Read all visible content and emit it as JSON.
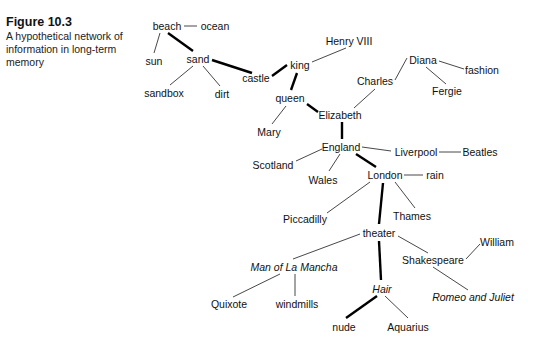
{
  "caption": {
    "figure_label": "Figure 10.3",
    "description": "A hypothetical network of information in long-term memory"
  },
  "nodes": {
    "beach": {
      "label": "beach",
      "x": 167,
      "y": 26,
      "italic": false
    },
    "ocean": {
      "label": "ocean",
      "x": 215,
      "y": 26,
      "italic": false
    },
    "sun": {
      "label": "sun",
      "x": 154,
      "y": 61,
      "italic": false
    },
    "sand": {
      "label": "sand",
      "x": 198,
      "y": 59,
      "italic": false
    },
    "sandbox": {
      "label": "sandbox",
      "x": 164,
      "y": 93,
      "italic": false
    },
    "dirt": {
      "label": "dirt",
      "x": 222,
      "y": 94,
      "italic": false
    },
    "castle": {
      "label": "castle",
      "x": 256,
      "y": 78,
      "italic": false
    },
    "king": {
      "label": "king",
      "x": 300,
      "y": 65,
      "italic": false
    },
    "henry": {
      "label": "Henry VIII",
      "x": 349,
      "y": 41,
      "italic": false
    },
    "queen": {
      "label": "queen",
      "x": 290,
      "y": 98,
      "italic": false
    },
    "mary": {
      "label": "Mary",
      "x": 269,
      "y": 132,
      "italic": false
    },
    "elizabeth": {
      "label": "Elizabeth",
      "x": 340,
      "y": 115,
      "italic": false
    },
    "charles": {
      "label": "Charles",
      "x": 375,
      "y": 81,
      "italic": false
    },
    "diana": {
      "label": "Diana",
      "x": 423,
      "y": 60,
      "italic": false
    },
    "fashion": {
      "label": "fashion",
      "x": 482,
      "y": 70,
      "italic": false
    },
    "fergie": {
      "label": "Fergie",
      "x": 447,
      "y": 91,
      "italic": false
    },
    "england": {
      "label": "England",
      "x": 341,
      "y": 147,
      "italic": false
    },
    "scotland": {
      "label": "Scotland",
      "x": 273,
      "y": 165,
      "italic": false
    },
    "wales": {
      "label": "Wales",
      "x": 323,
      "y": 180,
      "italic": false
    },
    "liverpool": {
      "label": "Liverpool",
      "x": 416,
      "y": 152,
      "italic": false
    },
    "beatles": {
      "label": "Beatles",
      "x": 480,
      "y": 152,
      "italic": false
    },
    "london": {
      "label": "London",
      "x": 385,
      "y": 175,
      "italic": false
    },
    "rain": {
      "label": "rain",
      "x": 435,
      "y": 175,
      "italic": false
    },
    "piccadilly": {
      "label": "Piccadilly",
      "x": 305,
      "y": 219,
      "italic": false
    },
    "thames": {
      "label": "Thames",
      "x": 412,
      "y": 216,
      "italic": false
    },
    "theater": {
      "label": "theater",
      "x": 379,
      "y": 233,
      "italic": false
    },
    "mancha": {
      "label": "Man of La Mancha",
      "x": 294,
      "y": 267,
      "italic": true
    },
    "shakespeare": {
      "label": "Shakespeare",
      "x": 433,
      "y": 260,
      "italic": false
    },
    "william": {
      "label": "William",
      "x": 497,
      "y": 242,
      "italic": false
    },
    "quixote": {
      "label": "Quixote",
      "x": 229,
      "y": 304,
      "italic": false
    },
    "windmills": {
      "label": "windmills",
      "x": 297,
      "y": 304,
      "italic": false
    },
    "hair": {
      "label": "Hair",
      "x": 382,
      "y": 289,
      "italic": true
    },
    "romeo": {
      "label": "Romeo and Juliet",
      "x": 473,
      "y": 297,
      "italic": true
    },
    "nude": {
      "label": "nude",
      "x": 344,
      "y": 327,
      "italic": false
    },
    "aquarius": {
      "label": "Aquarius",
      "x": 408,
      "y": 327,
      "italic": false
    }
  },
  "edges": [
    {
      "from": "beach",
      "to": "ocean",
      "x1": 184,
      "y1": 26,
      "x2": 197,
      "y2": 26,
      "weight": "thin"
    },
    {
      "from": "beach",
      "to": "sun",
      "x1": 160,
      "y1": 33,
      "x2": 154,
      "y2": 53,
      "weight": "thin"
    },
    {
      "from": "beach",
      "to": "sand",
      "x1": 168,
      "y1": 33,
      "x2": 193,
      "y2": 51,
      "weight": "thick"
    },
    {
      "from": "sand",
      "to": "sandbox",
      "x1": 193,
      "y1": 66,
      "x2": 170,
      "y2": 85,
      "weight": "thin"
    },
    {
      "from": "sand",
      "to": "dirt",
      "x1": 203,
      "y1": 66,
      "x2": 220,
      "y2": 86,
      "weight": "thin"
    },
    {
      "from": "sand",
      "to": "castle",
      "x1": 212,
      "y1": 60,
      "x2": 252,
      "y2": 73,
      "weight": "thick"
    },
    {
      "from": "castle",
      "to": "king",
      "x1": 272,
      "y1": 76,
      "x2": 287,
      "y2": 65,
      "weight": "thick"
    },
    {
      "from": "king",
      "to": "henry",
      "x1": 312,
      "y1": 62,
      "x2": 346,
      "y2": 48,
      "weight": "thin"
    },
    {
      "from": "king",
      "to": "queen",
      "x1": 297,
      "y1": 73,
      "x2": 291,
      "y2": 90,
      "weight": "thick"
    },
    {
      "from": "queen",
      "to": "mary",
      "x1": 286,
      "y1": 106,
      "x2": 272,
      "y2": 124,
      "weight": "thin"
    },
    {
      "from": "queen",
      "to": "elizabeth",
      "x1": 307,
      "y1": 104,
      "x2": 318,
      "y2": 112,
      "weight": "thick"
    },
    {
      "from": "elizabeth",
      "to": "charles",
      "x1": 354,
      "y1": 108,
      "x2": 375,
      "y2": 89,
      "weight": "thin"
    },
    {
      "from": "charles",
      "to": "diana",
      "x1": 395,
      "y1": 80,
      "x2": 407,
      "y2": 58,
      "weight": "thin"
    },
    {
      "from": "diana",
      "to": "fashion",
      "x1": 439,
      "y1": 61,
      "x2": 464,
      "y2": 69,
      "weight": "thin"
    },
    {
      "from": "diana",
      "to": "fergie",
      "x1": 426,
      "y1": 67,
      "x2": 446,
      "y2": 84,
      "weight": "thin"
    },
    {
      "from": "elizabeth",
      "to": "england",
      "x1": 342,
      "y1": 122,
      "x2": 342,
      "y2": 139,
      "weight": "thick"
    },
    {
      "from": "england",
      "to": "scotland",
      "x1": 322,
      "y1": 149,
      "x2": 296,
      "y2": 161,
      "weight": "thin"
    },
    {
      "from": "england",
      "to": "wales",
      "x1": 340,
      "y1": 154,
      "x2": 329,
      "y2": 171,
      "weight": "thin"
    },
    {
      "from": "england",
      "to": "liverpool",
      "x1": 362,
      "y1": 147,
      "x2": 391,
      "y2": 151,
      "weight": "thin"
    },
    {
      "from": "liverpool",
      "to": "beatles",
      "x1": 439,
      "y1": 152,
      "x2": 461,
      "y2": 152,
      "weight": "thin"
    },
    {
      "from": "england",
      "to": "london",
      "x1": 356,
      "y1": 154,
      "x2": 376,
      "y2": 167,
      "weight": "thick"
    },
    {
      "from": "london",
      "to": "rain",
      "x1": 404,
      "y1": 175,
      "x2": 423,
      "y2": 175,
      "weight": "thin"
    },
    {
      "from": "london",
      "to": "piccadilly",
      "x1": 370,
      "y1": 182,
      "x2": 327,
      "y2": 213,
      "weight": "thin"
    },
    {
      "from": "london",
      "to": "thames",
      "x1": 395,
      "y1": 182,
      "x2": 415,
      "y2": 208,
      "weight": "thin"
    },
    {
      "from": "london",
      "to": "theater",
      "x1": 383,
      "y1": 183,
      "x2": 379,
      "y2": 224,
      "weight": "thick"
    },
    {
      "from": "theater",
      "to": "mancha",
      "x1": 360,
      "y1": 234,
      "x2": 293,
      "y2": 259,
      "weight": "thin"
    },
    {
      "from": "theater",
      "to": "shakespeare",
      "x1": 398,
      "y1": 236,
      "x2": 428,
      "y2": 253,
      "weight": "thin"
    },
    {
      "from": "shakespeare",
      "to": "william",
      "x1": 466,
      "y1": 259,
      "x2": 480,
      "y2": 244,
      "weight": "thin"
    },
    {
      "from": "shakespeare",
      "to": "romeo",
      "x1": 433,
      "y1": 267,
      "x2": 468,
      "y2": 290,
      "weight": "thin"
    },
    {
      "from": "theater",
      "to": "hair",
      "x1": 379,
      "y1": 241,
      "x2": 381,
      "y2": 280,
      "weight": "thick"
    },
    {
      "from": "mancha",
      "to": "quixote",
      "x1": 280,
      "y1": 274,
      "x2": 233,
      "y2": 297,
      "weight": "thin"
    },
    {
      "from": "mancha",
      "to": "windmills",
      "x1": 295,
      "y1": 274,
      "x2": 295,
      "y2": 296,
      "weight": "thin"
    },
    {
      "from": "hair",
      "to": "nude",
      "x1": 377,
      "y1": 296,
      "x2": 346,
      "y2": 318,
      "weight": "thick"
    },
    {
      "from": "hair",
      "to": "aquarius",
      "x1": 385,
      "y1": 296,
      "x2": 408,
      "y2": 318,
      "weight": "thin"
    }
  ],
  "colors": {
    "background": "#ffffff",
    "text": "#111111",
    "line": "#000000"
  }
}
